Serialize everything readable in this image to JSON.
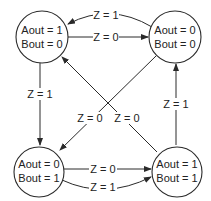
{
  "diagram": {
    "type": "state-machine",
    "states": [
      {
        "id": "s10",
        "line1": "Aout = 1",
        "line2": "Bout = 0"
      },
      {
        "id": "s00",
        "line1": "Aout = 0",
        "line2": "Bout = 0"
      },
      {
        "id": "s01",
        "line1": "Aout = 0",
        "line2": "Bout = 1"
      },
      {
        "id": "s11",
        "line1": "Aout = 1",
        "line2": "Bout = 1"
      }
    ],
    "transitions": [
      {
        "from": "s00",
        "to": "s10",
        "label": "Z = 1"
      },
      {
        "from": "s10",
        "to": "s00",
        "label": "Z = 0"
      },
      {
        "from": "s10",
        "to": "s01",
        "label": "Z = 1"
      },
      {
        "from": "s00",
        "to": "s01",
        "label": "Z = 0"
      },
      {
        "from": "s11",
        "to": "s10",
        "label": "Z = 0"
      },
      {
        "from": "s11",
        "to": "s00",
        "label": "Z = 1"
      },
      {
        "from": "s01",
        "to": "s11",
        "label": "Z = 0"
      },
      {
        "from": "s01",
        "to": "s11",
        "label": "Z = 1"
      }
    ]
  }
}
